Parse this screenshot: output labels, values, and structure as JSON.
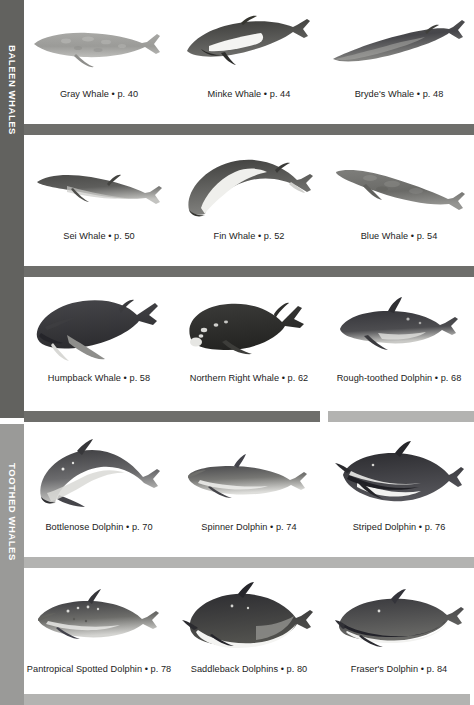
{
  "sections": [
    {
      "id": "baleen",
      "label": "BALEEN WHALES",
      "color": "#62625f"
    },
    {
      "id": "toothed",
      "label": "TOOTHED WHALES",
      "color": "#9a9a98"
    }
  ],
  "rows": [
    {
      "index": 1,
      "cells": [
        {
          "name": "Gray Whale",
          "page": "p. 40",
          "caption": "Gray Whale • p. 40",
          "section": "baleen",
          "art": "gray-whale"
        },
        {
          "name": "Minke Whale",
          "page": "p. 44",
          "caption": "Minke Whale • p. 44",
          "section": "baleen",
          "art": "minke-whale"
        },
        {
          "name": "Bryde's Whale",
          "page": "p. 48",
          "caption": "Bryde's Whale • p. 48",
          "section": "baleen",
          "art": "brydes-whale"
        }
      ]
    },
    {
      "index": 2,
      "cells": [
        {
          "name": "Sei Whale",
          "page": "p. 50",
          "caption": "Sei Whale • p. 50",
          "section": "baleen",
          "art": "sei-whale"
        },
        {
          "name": "Fin Whale",
          "page": "p. 52",
          "caption": "Fin Whale • p. 52",
          "section": "baleen",
          "art": "fin-whale"
        },
        {
          "name": "Blue Whale",
          "page": "p. 54",
          "caption": "Blue Whale • p. 54",
          "section": "baleen",
          "art": "blue-whale"
        }
      ]
    },
    {
      "index": 3,
      "cells": [
        {
          "name": "Humpback Whale",
          "page": "p. 58",
          "caption": "Humpback Whale • p. 58",
          "section": "baleen",
          "art": "humpback-whale"
        },
        {
          "name": "Northern Right Whale",
          "page": "p. 62",
          "caption": "Northern Right Whale • p. 62",
          "section": "baleen",
          "art": "northern-right-whale"
        },
        {
          "name": "Rough-toothed Dolphin",
          "page": "p. 68",
          "caption": "Rough-toothed Dolphin • p. 68",
          "section": "toothed",
          "art": "rough-toothed-dolphin"
        }
      ]
    },
    {
      "index": 4,
      "cells": [
        {
          "name": "Bottlenose Dolphin",
          "page": "p. 70",
          "caption": "Bottlenose Dolphin • p. 70",
          "section": "toothed",
          "art": "bottlenose-dolphin"
        },
        {
          "name": "Spinner Dolphin",
          "page": "p. 74",
          "caption": "Spinner Dolphin • p. 74",
          "section": "toothed",
          "art": "spinner-dolphin"
        },
        {
          "name": "Striped Dolphin",
          "page": "p. 76",
          "caption": "Striped Dolphin • p. 76",
          "section": "toothed",
          "art": "striped-dolphin"
        }
      ]
    },
    {
      "index": 5,
      "cells": [
        {
          "name": "Pantropical Spotted Dolphin",
          "page": "p. 78",
          "caption": "Pantropical Spotted Dolphin • p. 78",
          "section": "toothed",
          "art": "pantropical-spotted-dolphin"
        },
        {
          "name": "Saddleback Dolphins",
          "page": "p. 80",
          "caption": "Saddleback Dolphins • p. 80",
          "section": "toothed",
          "art": "saddleback-dolphins"
        },
        {
          "name": "Fraser's Dolphin",
          "page": "p. 84",
          "caption": "Fraser's Dolphin • p. 84",
          "section": "toothed",
          "art": "frasers-dolphin"
        }
      ]
    }
  ],
  "colors": {
    "bar_dark": "#6e6e6b",
    "bar_light": "#b3b3b1",
    "rail_baleen": "#62625f",
    "rail_toothed": "#9a9a98",
    "page_background": "#ffffff",
    "caption_text": "#1c1c1c"
  }
}
